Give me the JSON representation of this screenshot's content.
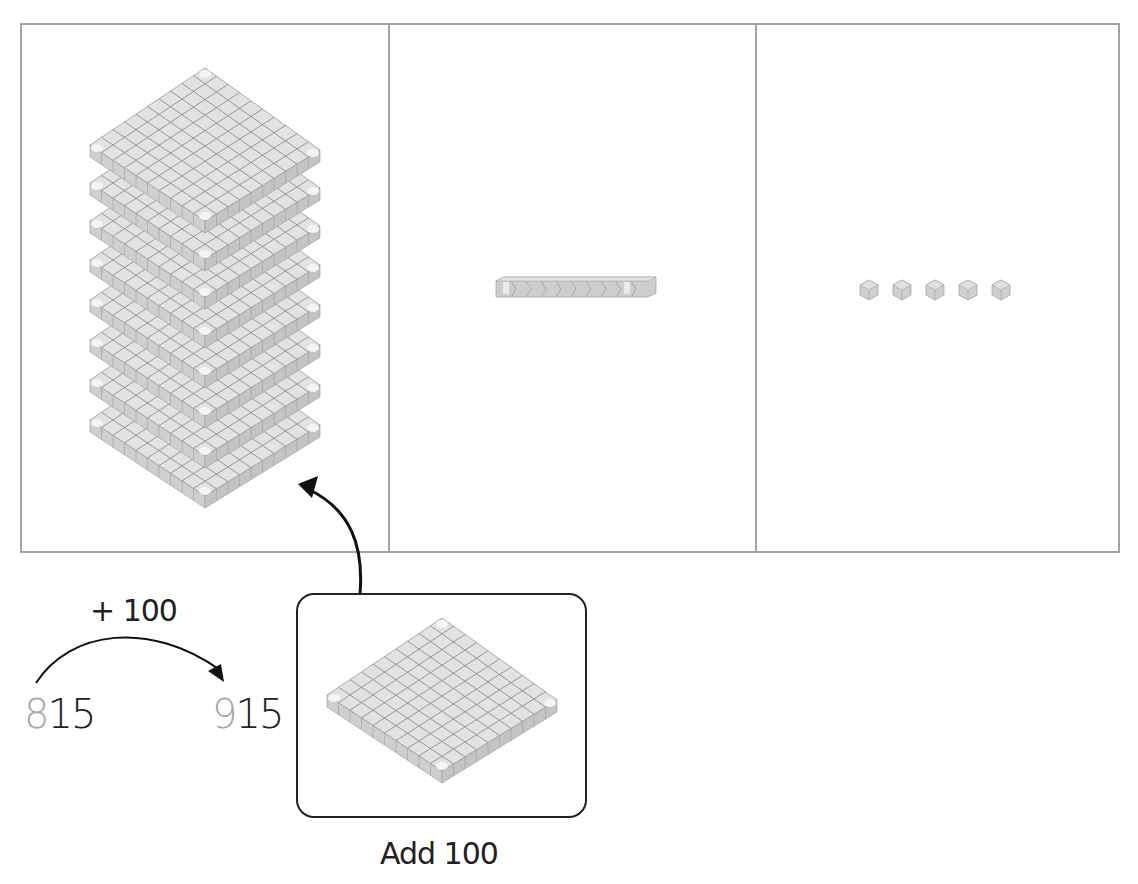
{
  "diagram": {
    "panels": [
      {
        "id": "hundreds",
        "block": "flat",
        "count": 8,
        "value_each": 100
      },
      {
        "id": "tens",
        "block": "rod",
        "count": 1,
        "value_each": 10
      },
      {
        "id": "ones",
        "block": "unit-cube",
        "count": 5,
        "value_each": 1
      }
    ],
    "jump": {
      "label": "+ 100",
      "start": {
        "changed_digit": "8",
        "rest": "15",
        "full": "815"
      },
      "end": {
        "changed_digit": "9",
        "rest": "15",
        "full": "915"
      }
    },
    "add_card": {
      "block": "flat",
      "count": 1,
      "caption": "Add 100"
    },
    "colors": {
      "panel_border": "#a3a3a3",
      "block_fill": "#dcdcdc",
      "block_grid": "#8a8a8a",
      "highlight_digit": "#a8a8a8",
      "text": "#222222"
    }
  }
}
